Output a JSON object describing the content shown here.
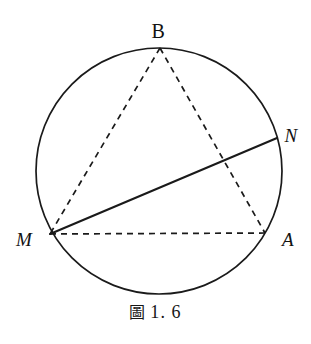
{
  "figure": {
    "caption_mark": "圖",
    "caption_number": "1. 6",
    "caption_full": "圖 1.6",
    "background_color": "#ffffff",
    "stroke_color": "#1a1a1a"
  },
  "labels": {
    "B": "B",
    "N": "N",
    "M": "M",
    "A": "A"
  },
  "chart_data": {
    "type": "diagram",
    "canvas": {
      "width": 311,
      "height": 344
    },
    "circle": {
      "name": "circumcircle",
      "cx": 159,
      "cy": 171,
      "r": 123,
      "stroke": "#1a1a1a",
      "stroke_width": 1.7,
      "style": "solid",
      "fill": "none"
    },
    "points": [
      {
        "id": "B",
        "label": "B",
        "x": 160,
        "y": 48,
        "label_style": "roman",
        "label_x": 158,
        "label_y": 31,
        "on_circle": true
      },
      {
        "id": "N",
        "label": "N",
        "x": 277,
        "y": 138,
        "label_style": "italic",
        "label_x": 291,
        "label_y": 135,
        "on_circle": true
      },
      {
        "id": "M",
        "label": "M",
        "x": 50,
        "y": 234,
        "label_style": "italic",
        "label_x": 24,
        "label_y": 239,
        "on_circle": true
      },
      {
        "id": "A",
        "label": "A",
        "x": 265,
        "y": 233,
        "label_style": "italic",
        "label_x": 288,
        "label_y": 239,
        "on_circle": true
      }
    ],
    "segments": [
      {
        "id": "MN",
        "from": "M",
        "to": "N",
        "style": "solid",
        "stroke": "#1a1a1a",
        "stroke_width": 2.1
      },
      {
        "id": "BM",
        "from": "B",
        "to": "M",
        "style": "dashed",
        "stroke": "#1a1a1a",
        "stroke_width": 1.7,
        "dash": "6 5"
      },
      {
        "id": "BA",
        "from": "B",
        "to": "A",
        "style": "dashed",
        "stroke": "#1a1a1a",
        "stroke_width": 1.7,
        "dash": "6 5"
      },
      {
        "id": "MA",
        "from": "M",
        "to": "A",
        "style": "dashed",
        "stroke": "#1a1a1a",
        "stroke_width": 1.7,
        "dash": "6 5"
      }
    ],
    "intersections": [
      {
        "id": "MN-x-BA",
        "of": [
          "MN",
          "BA"
        ],
        "x": 222,
        "y": 162
      }
    ]
  }
}
